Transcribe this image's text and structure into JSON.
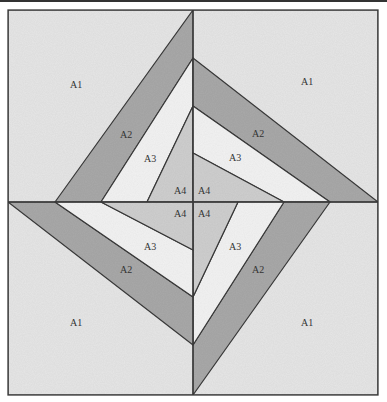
{
  "diagram": {
    "colors": {
      "A1": "#e6e6e6",
      "A2": "#a9a9a9",
      "A3": "#f3f3f3",
      "A4": "#cfcfcf",
      "outline": "#3a3a3a"
    },
    "labels": {
      "tl_a1": "A1",
      "tl_a2": "A2",
      "tl_a3": "A3",
      "tl_a4": "A4",
      "tr_a1": "A1",
      "tr_a2": "A2",
      "tr_a3": "A3",
      "tr_a4": "A4",
      "bl_a1": "A1",
      "bl_a2": "A2",
      "bl_a3": "A3",
      "bl_a4": "A4",
      "br_a1": "A1",
      "br_a2": "A2",
      "br_a3": "A3",
      "br_a4": "A4"
    }
  }
}
